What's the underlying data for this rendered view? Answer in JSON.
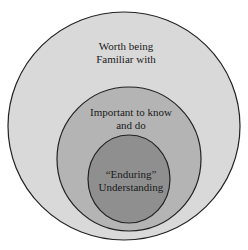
{
  "diagram": {
    "type": "nested-circles",
    "layers": [
      {
        "label_line1": "Worth being",
        "label_line2": "Familiar with",
        "fill": "#d9d9d9",
        "stroke": "#222222"
      },
      {
        "label_line1": "Important to know",
        "label_line2": "and do",
        "fill": "#b4b4b4",
        "stroke": "#222222"
      },
      {
        "label_line1": "“Enduring”",
        "label_line2": "Understanding",
        "fill": "#8f8f8f",
        "stroke": "#222222"
      }
    ]
  }
}
